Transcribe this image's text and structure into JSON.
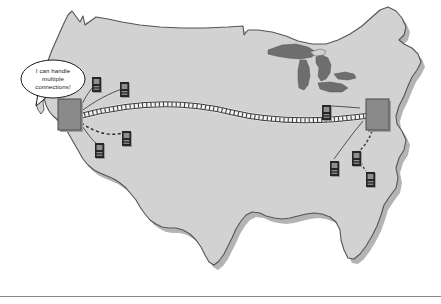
{
  "figure": {
    "background_color": "#ffffff"
  },
  "map": {
    "name": "united-states-map",
    "land_fill": "#d2d2d2",
    "land_stroke": "#555555",
    "shadow_fill": "#b4b4b4",
    "lakes_fill": "#6e6e6e",
    "lakes_name": "great-lakes"
  },
  "callout": {
    "name": "speech-bubble",
    "lines": [
      "I can handle",
      "multiple",
      "connections!"
    ],
    "text": "I can handle multiple connections!",
    "fill": "#ffffff",
    "stroke": "#1a1a1a"
  },
  "routers": [
    {
      "id": "router-west",
      "label": "",
      "x": 58,
      "y": 99,
      "width": 23,
      "height": 31,
      "fill": "#8a8a8a",
      "stroke": "#4a4a4a"
    },
    {
      "id": "router-east",
      "label": "",
      "x": 366,
      "y": 99,
      "width": 23,
      "height": 31,
      "fill": "#8a8a8a",
      "stroke": "#4a4a4a"
    }
  ],
  "backbone": {
    "name": "backbone-link",
    "style": "double-line-with-ties",
    "stroke": "#3c3c3c",
    "from": "router-west",
    "to": "router-east"
  },
  "computers": [
    {
      "id": "computer-nw-1",
      "x": 92,
      "y": 77,
      "connects_to": "router-west"
    },
    {
      "id": "computer-nw-2",
      "x": 120,
      "y": 82,
      "connects_to": "router-west"
    },
    {
      "id": "computer-sw-1",
      "x": 95,
      "y": 143,
      "connects_to": "router-west"
    },
    {
      "id": "computer-sw-2",
      "x": 122,
      "y": 131,
      "connects_to": "router-west"
    },
    {
      "id": "computer-mw-1",
      "x": 322,
      "y": 105,
      "connects_to": "router-east"
    },
    {
      "id": "computer-se-1",
      "x": 330,
      "y": 161,
      "connects_to": "router-east"
    },
    {
      "id": "computer-se-2",
      "x": 352,
      "y": 151,
      "connects_to": "router-east"
    },
    {
      "id": "computer-se-3",
      "x": 366,
      "y": 172,
      "connects_to": "router-east"
    }
  ],
  "computer_style": {
    "body_fill": "#262626",
    "screen_fill": "#8f8f8f",
    "width": 9,
    "height": 15
  },
  "links": {
    "name": "access-links",
    "style": "dashed",
    "stroke": "#3c3c3c"
  },
  "footer_rule": {
    "name": "footer-divider",
    "color": "#8a8a8a",
    "y": 296
  }
}
